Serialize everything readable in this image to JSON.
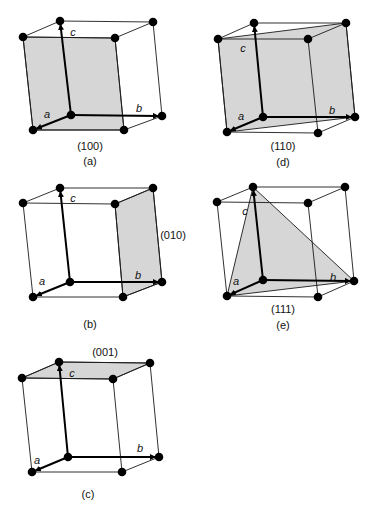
{
  "figure": {
    "colors": {
      "plane_fill": "#d6d6d6",
      "edge": "#1a1a1a",
      "atom": "#000000"
    },
    "axis_labels": {
      "a": "a",
      "b": "b",
      "c": "c"
    },
    "panels": [
      {
        "id": "a",
        "caption": "(a)",
        "plane": "(100)",
        "vertices": {
          "O": [
            71,
            115
          ],
          "B": [
            162,
            116
          ],
          "A": [
            33,
            130
          ],
          "AB": [
            124,
            130
          ],
          "C": [
            60,
            21
          ],
          "BC": [
            153,
            22
          ],
          "AC": [
            23,
            37
          ],
          "ABC": [
            115,
            38
          ]
        },
        "plane_polygon": [
          "AC",
          "ABC",
          "AB",
          "A"
        ],
        "plane_label_pos": [
          90,
          150
        ],
        "caption_pos": [
          90,
          165
        ],
        "axis_label_pos": {
          "a": [
            47,
            118
          ],
          "b": [
            139,
            112
          ],
          "c": [
            73,
            36
          ]
        }
      },
      {
        "id": "d",
        "caption": "(d)",
        "plane": "(110)",
        "vertices": {
          "O": [
            263,
            117
          ],
          "B": [
            355,
            117
          ],
          "A": [
            227,
            132
          ],
          "AB": [
            318,
            133
          ],
          "C": [
            254,
            23
          ],
          "BC": [
            346,
            23
          ],
          "AC": [
            218,
            39
          ],
          "ABC": [
            308,
            39
          ]
        },
        "plane_polygon": [
          "AC",
          "BC",
          "B",
          "A"
        ],
        "plane_label_pos": [
          283,
          150
        ],
        "caption_pos": [
          283,
          166
        ],
        "axis_label_pos": {
          "a": [
            241,
            120
          ],
          "b": [
            332,
            114
          ],
          "c": [
            243,
            52
          ]
        }
      },
      {
        "id": "b",
        "caption": "(b)",
        "plane": "(010)",
        "vertices": {
          "O": [
            70,
            282
          ],
          "B": [
            162,
            282
          ],
          "A": [
            33,
            297
          ],
          "AB": [
            123,
            297
          ],
          "C": [
            60,
            188
          ],
          "BC": [
            153,
            188
          ],
          "AC": [
            23,
            203
          ],
          "ABC": [
            115,
            204
          ]
        },
        "plane_polygon": [
          "ABC",
          "BC",
          "B",
          "AB"
        ],
        "plane_label_pos": [
          173,
          239
        ],
        "caption_pos": [
          90,
          328
        ],
        "axis_label_pos": {
          "a": [
            42,
            285
          ],
          "b": [
            138,
            279
          ],
          "c": [
            73,
            202
          ]
        }
      },
      {
        "id": "e",
        "caption": "(e)",
        "plane": "(111)",
        "vertices": {
          "O": [
            263,
            280
          ],
          "B": [
            354,
            281
          ],
          "A": [
            227,
            296
          ],
          "AB": [
            318,
            297
          ],
          "C": [
            253,
            187
          ],
          "BC": [
            345,
            187
          ],
          "AC": [
            217,
            202
          ],
          "ABC": [
            308,
            203
          ]
        },
        "plane_polygon": [
          "A",
          "B",
          "C"
        ],
        "plane_label_pos": [
          283,
          313
        ],
        "caption_pos": [
          283,
          329
        ],
        "axis_label_pos": {
          "a": [
            236,
            285
          ],
          "b": [
            333,
            281
          ],
          "c": [
            245,
            215
          ]
        }
      },
      {
        "id": "c",
        "caption": "(c)",
        "plane": "(001)",
        "vertices": {
          "O": [
            68,
            457
          ],
          "B": [
            159,
            457
          ],
          "A": [
            32,
            472
          ],
          "AB": [
            122,
            472
          ],
          "C": [
            59,
            362
          ],
          "BC": [
            150,
            363
          ],
          "AC": [
            22,
            378
          ],
          "ABC": [
            113,
            379
          ]
        },
        "plane_polygon": [
          "C",
          "BC",
          "ABC",
          "AC"
        ],
        "plane_label_pos": [
          105,
          356
        ],
        "caption_pos": [
          88,
          498
        ],
        "axis_label_pos": {
          "a": [
            37,
            464
          ],
          "b": [
            140,
            452
          ],
          "c": [
            72,
            377
          ]
        }
      }
    ]
  }
}
